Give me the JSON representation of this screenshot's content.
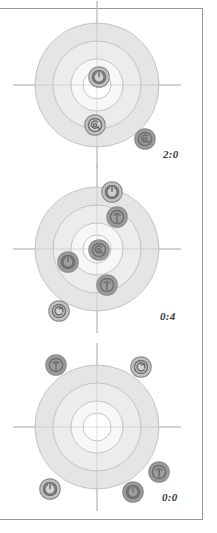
{
  "figure": {
    "type": "curling-house-diagrams",
    "panel_count": 3,
    "colors": {
      "page_background": "#ffffff",
      "rule": "#9a9a9a",
      "ring_outer_fill": "#e3e3e3",
      "ring_mid_fill": "#ededed",
      "ring_inner_fill": "#f7f7f7",
      "button_fill": "#ffffff",
      "ring_stroke": "#bdbdbd",
      "crosshair": "#b8b8b8",
      "stone_light": "#cfcfcf",
      "stone_dark": "#9e9e9e",
      "stone_edge": "#8d8d8d",
      "glyph": "#6e6e6e",
      "score_text": "#3a3a3a"
    }
  },
  "panels": [
    {
      "id": "panel-1",
      "score_label": "2:0",
      "house": {
        "center_x": 97,
        "center_y": 85,
        "radii": [
          62,
          44,
          26,
          14
        ]
      },
      "stones": [
        {
          "id": "p1-s1",
          "glyph": "power-swirl",
          "shade": "light",
          "cx": 99,
          "cy": 77,
          "r": 11
        },
        {
          "id": "p1-s2",
          "glyph": "spiral-at",
          "shade": "light",
          "cx": 95,
          "cy": 125,
          "r": 11
        },
        {
          "id": "p1-s3",
          "glyph": "spiral-dark",
          "shade": "dark",
          "cx": 145,
          "cy": 139,
          "r": 11
        }
      ],
      "score_x": 163,
      "score_y": 148
    },
    {
      "id": "panel-2",
      "score_label": "0:4",
      "house": {
        "center_x": 97,
        "center_y": 249,
        "radii": [
          62,
          44,
          26,
          14
        ]
      },
      "stones": [
        {
          "id": "p2-s1",
          "glyph": "power-swirl",
          "shade": "light",
          "cx": 112,
          "cy": 192,
          "r": 11
        },
        {
          "id": "p2-s2",
          "glyph": "antenna",
          "shade": "dark",
          "cx": 117,
          "cy": 217,
          "r": 11
        },
        {
          "id": "p2-s3",
          "glyph": "spiral-dark",
          "shade": "dark",
          "cx": 99,
          "cy": 250,
          "r": 11
        },
        {
          "id": "p2-s4",
          "glyph": "power-swirl",
          "shade": "dark",
          "cx": 68,
          "cy": 262,
          "r": 11
        },
        {
          "id": "p2-s5",
          "glyph": "antenna",
          "shade": "dark",
          "cx": 107,
          "cy": 285,
          "r": 11
        },
        {
          "id": "p2-s6",
          "glyph": "arrow-loop",
          "shade": "light",
          "cx": 59,
          "cy": 311,
          "r": 11
        }
      ],
      "score_x": 160,
      "score_y": 310
    },
    {
      "id": "panel-3",
      "score_label": "0:0",
      "house": {
        "center_x": 97,
        "center_y": 427,
        "radii": [
          62,
          44,
          26,
          14
        ]
      },
      "stones": [
        {
          "id": "p3-s1",
          "glyph": "antenna",
          "shade": "dark",
          "cx": 56,
          "cy": 365,
          "r": 11
        },
        {
          "id": "p3-s2",
          "glyph": "arrow-loop",
          "shade": "light",
          "cx": 141,
          "cy": 367,
          "r": 11
        },
        {
          "id": "p3-s3",
          "glyph": "power-swirl",
          "shade": "light",
          "cx": 50,
          "cy": 489,
          "r": 11
        },
        {
          "id": "p3-s4",
          "glyph": "antenna",
          "shade": "dark",
          "cx": 159,
          "cy": 472,
          "r": 11
        },
        {
          "id": "p3-s5",
          "glyph": "power-swirl",
          "shade": "dark",
          "cx": 133,
          "cy": 492,
          "r": 11
        }
      ],
      "score_x": 162,
      "score_y": 491
    }
  ]
}
